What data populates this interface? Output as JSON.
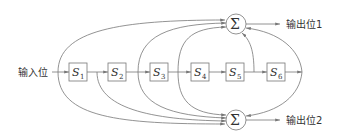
{
  "diagram": {
    "type": "convolutional-encoder",
    "input_label": "输入位",
    "registers": [
      {
        "name": "S",
        "sub": "1"
      },
      {
        "name": "S",
        "sub": "2"
      },
      {
        "name": "S",
        "sub": "3"
      },
      {
        "name": "S",
        "sub": "4"
      },
      {
        "name": "S",
        "sub": "5"
      },
      {
        "name": "S",
        "sub": "6"
      }
    ],
    "adders": [
      {
        "symbol": "Σ",
        "output_label": "输出位1"
      },
      {
        "symbol": "Σ",
        "output_label": "输出位2"
      }
    ],
    "colors": {
      "line": "#777777",
      "text": "#333333"
    }
  }
}
